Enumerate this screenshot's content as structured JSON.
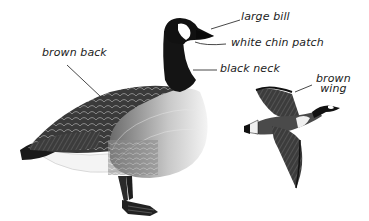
{
  "diagram": {
    "figures": [
      {
        "id": "standing-goose",
        "pose": "standing, side view"
      },
      {
        "id": "flying-goose",
        "pose": "in flight"
      }
    ],
    "labels": [
      {
        "id": "large-bill",
        "text": "large bill"
      },
      {
        "id": "white-chin-patch",
        "text": "white chin patch"
      },
      {
        "id": "black-neck",
        "text": "black neck"
      },
      {
        "id": "brown-back",
        "text": "brown back"
      },
      {
        "id": "brown-wing",
        "line1": "brown",
        "line2": "wing"
      }
    ]
  },
  "colors": {
    "background": "#ffffff",
    "ink": "#222222",
    "dark_plumage": "#1a1a1a",
    "mid_plumage": "#555555",
    "light_breast": "#d8d8d8",
    "white_patch": "#ffffff"
  }
}
